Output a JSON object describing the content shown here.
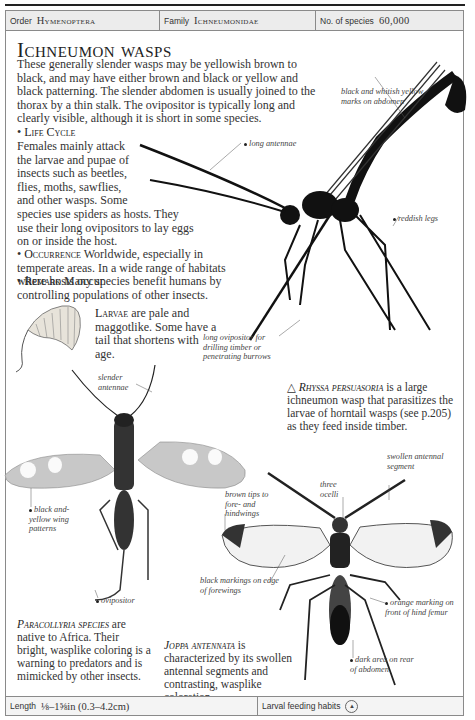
{
  "header": {
    "order_label": "Order",
    "order_value": "Hymenoptera",
    "family_label": "Family",
    "family_value": "Ichneumonidae",
    "species_label": "No. of species",
    "species_value": "60,000"
  },
  "title": "Ichneumon wasps",
  "intro": "These generally slender wasps may be yellowish brown to black, and may have either brown and black or yellow and black patterning. The slender abdomen is usually joined to the thorax by a thin stalk. The ovipositor is typically long and clearly visible, although it is short in some species.",
  "sections": [
    {
      "heading": "Life Cycle",
      "lines": [
        "Females mainly attack",
        "the larvae and pupae of",
        "insects such as beetles,",
        "flies, moths, sawflies,",
        "and other wasps. Some",
        "species use spiders as hosts. They",
        "use their long ovipositors to lay eggs",
        "on or inside the host."
      ]
    },
    {
      "heading": "Occurrence",
      "text": "Worldwide, especially in temperate areas. In a wide range of habitats where hosts occur."
    },
    {
      "heading": "Remark",
      "text": "Many species benefit humans by controlling populations of other insects."
    }
  ],
  "larvae": {
    "heading": "Larvae",
    "text": "are pale and maggotlike. Some have a tail that shortens with age."
  },
  "rhyssa": {
    "name": "Rhyssa persuasoria",
    "text": "is a large ichneumon wasp that parasitizes the larvae of horntail wasps (see p.205) as they feed inside timber.",
    "labels": [
      "black and whitish yellow marks on abdomen",
      "long antennae",
      "reddish legs",
      "long ovipositor for drilling timber or penetrating burrows"
    ]
  },
  "paracollyria": {
    "name": "Paracollyria species",
    "text": "are native to Africa. Their bright, wasplike coloring is a warning to predators and is mimicked by other insects.",
    "labels": [
      "slender antennae",
      "black and-yellow wing patterns",
      "ovipositor"
    ]
  },
  "joppa": {
    "name": "Joppa antennata",
    "text": "is characterized by its swollen antennal segments and contrasting, wasplike coloration.",
    "labels": [
      "swollen antennal segment",
      "three ocelli",
      "brown tips to fore- and hindwings",
      "black markings on edge of forewings",
      "orange marking on front of hind femur",
      "dark area on rear of abdomen"
    ]
  },
  "footer": {
    "length_label": "Length",
    "length_value": "⅛–1⅝in (0.3–4.2cm)",
    "habits_label": "Larval feeding habits"
  }
}
